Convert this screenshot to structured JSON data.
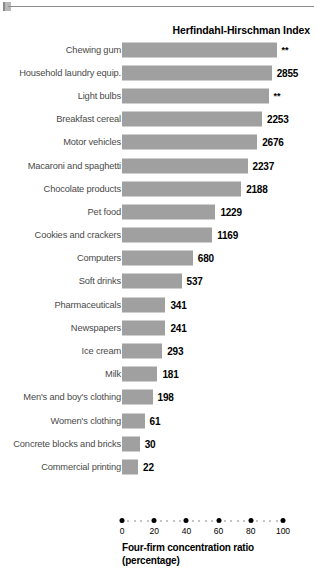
{
  "figure": {
    "title": "Herfindahl-Hirschman Index",
    "axis_title_line1": "Four-firm concentration ratio",
    "axis_title_line2": "(percentage)",
    "bar_color": "#a0a0a0",
    "label_color": "#4a4a4a",
    "value_color": "#000000"
  },
  "chart_data": {
    "type": "bar",
    "orientation": "horizontal",
    "title": "Herfindahl-Hirschman Index",
    "xlabel": "Four-firm concentration ratio (percentage)",
    "ylabel": "",
    "xlim": [
      0,
      100
    ],
    "xticks": [
      0,
      20,
      40,
      60,
      80,
      100
    ],
    "xtick_labels": [
      "0",
      "20",
      "40",
      "60",
      "80",
      "100"
    ],
    "grid": false,
    "legend": false,
    "value_label_note": "** = data not disclosed",
    "categories": [
      "Chewing gum",
      "Household laundry equip.",
      "Light bulbs",
      "Breakfast cereal",
      "Motor vehicles",
      "Macaroni and spaghetti",
      "Chocolate products",
      "Pet food",
      "Cookies and crackers",
      "Computers",
      "Soft drinks",
      "Pharmaceuticals",
      "Newspapers",
      "Ice cream",
      "Milk",
      "Men's and boy's clothing",
      "Women's clothing",
      "Concrete blocks and bricks",
      "Commercial printing"
    ],
    "values": [
      96,
      93,
      91,
      87,
      84,
      78,
      74,
      58,
      56,
      44,
      37,
      27,
      27,
      25,
      22,
      19,
      14,
      11,
      10
    ],
    "hhi_labels": [
      "**",
      "2855",
      "**",
      "2253",
      "2676",
      "2237",
      "2188",
      "1229",
      "1169",
      "680",
      "537",
      "341",
      "241",
      "293",
      "181",
      "198",
      "61",
      "30",
      "22"
    ]
  }
}
